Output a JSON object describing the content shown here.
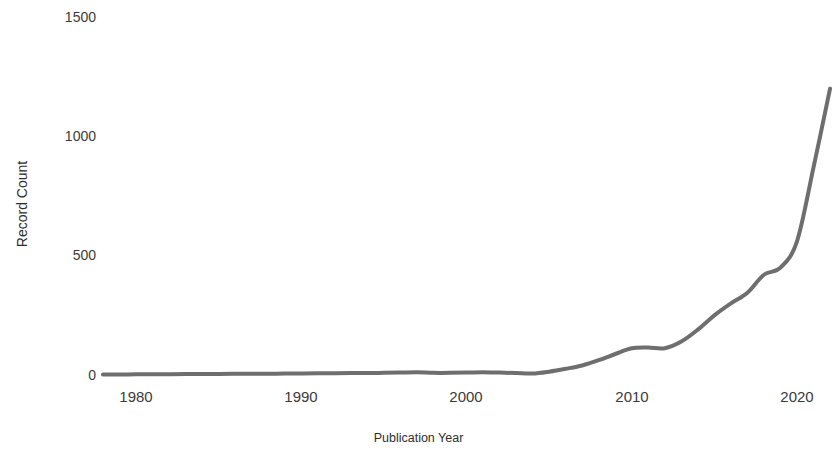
{
  "chart_data": {
    "type": "line",
    "title": "",
    "xlabel": "Publication Year",
    "ylabel": "Record Count",
    "xlim": [
      1977.8,
      2022.5
    ],
    "ylim": [
      0,
      1575
    ],
    "grid": false,
    "legend": null,
    "line_color": "#6e6e6e",
    "line_width": 4,
    "xticks": [
      {
        "value": 1980,
        "label": "1980"
      },
      {
        "value": 1990,
        "label": "1990"
      },
      {
        "value": 2000,
        "label": "2000"
      },
      {
        "value": 2010,
        "label": "2010"
      },
      {
        "value": 2020,
        "label": "2020"
      }
    ],
    "yticks": [
      {
        "value": 0,
        "label": "0"
      },
      {
        "value": 500,
        "label": "500"
      },
      {
        "value": 1000,
        "label": "1000"
      },
      {
        "value": 1500,
        "label": "1500"
      }
    ],
    "series": [
      {
        "name": "Record Count",
        "x": [
          1978,
          1979,
          1980,
          1981,
          1982,
          1983,
          1984,
          1985,
          1986,
          1987,
          1988,
          1989,
          1990,
          1991,
          1992,
          1993,
          1994,
          1995,
          1996,
          1997,
          1998,
          1999,
          2000,
          2001,
          2002,
          2003,
          2004,
          2005,
          2006,
          2007,
          2008,
          2009,
          2010,
          2011,
          2012,
          2013,
          2014,
          2015,
          2016,
          2017,
          2018,
          2019,
          2020,
          2021,
          2022
        ],
        "values": [
          2,
          2,
          3,
          3,
          3,
          4,
          4,
          4,
          5,
          5,
          5,
          6,
          6,
          7,
          7,
          8,
          8,
          9,
          10,
          11,
          9,
          9,
          10,
          12,
          10,
          8,
          6,
          14,
          26,
          40,
          62,
          88,
          112,
          115,
          112,
          140,
          190,
          250,
          300,
          345,
          420,
          450,
          560,
          870,
          1200
        ]
      }
    ]
  },
  "axis_titles": {
    "y": "Record Count",
    "x": "Publication Year"
  }
}
